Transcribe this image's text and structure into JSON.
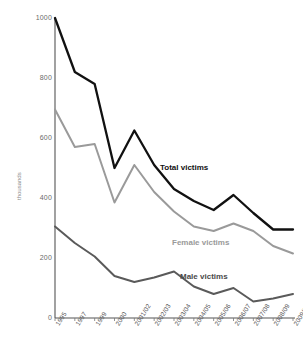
{
  "chart_data": {
    "type": "line",
    "title": "",
    "xlabel": "",
    "ylabel": "thousands",
    "ylim": [
      0,
      1000
    ],
    "yticks": [
      0,
      200,
      400,
      600,
      800,
      1000
    ],
    "grid": false,
    "legend_position": "inline-annotations",
    "categories": [
      "1995",
      "1997",
      "1999",
      "2000",
      "2001/02",
      "2002/03",
      "2003/04",
      "2004/05",
      "2005/06",
      "2006/07",
      "2007/08",
      "2008/09",
      "2009/10"
    ],
    "series": [
      {
        "name": "Total victims",
        "color": "#111111",
        "values": [
          1000,
          820,
          780,
          500,
          625,
          510,
          430,
          390,
          360,
          410,
          350,
          295,
          295
        ]
      },
      {
        "name": "Female victims",
        "color": "#9a9a9a",
        "values": [
          695,
          570,
          580,
          385,
          510,
          420,
          355,
          305,
          290,
          315,
          290,
          240,
          215
        ]
      },
      {
        "name": "Male victims",
        "color": "#5a5a5a",
        "values": [
          305,
          250,
          205,
          140,
          120,
          135,
          155,
          105,
          80,
          100,
          55,
          65,
          80
        ]
      }
    ],
    "annotations": [
      {
        "name": "Total victims",
        "x": 160,
        "y": 163
      },
      {
        "name": "Female victims",
        "x": 172,
        "y": 238
      },
      {
        "name": "Male victims",
        "x": 180,
        "y": 272
      }
    ]
  }
}
